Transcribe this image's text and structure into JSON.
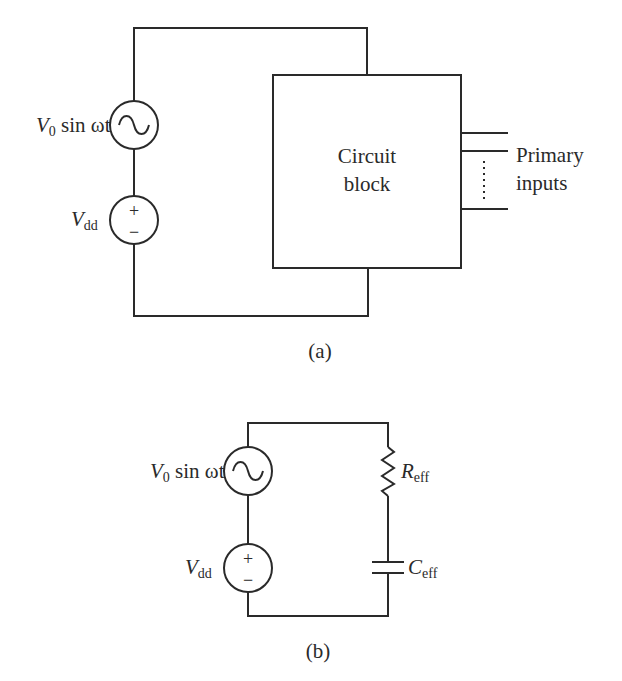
{
  "figure_a": {
    "caption": "(a)",
    "ac_source": {
      "label_main": "V",
      "label_sub": "0",
      "label_rest": " sin ωt",
      "icon": "sine-wave-icon"
    },
    "dc_source": {
      "label_main": "V",
      "label_sub": "dd",
      "plus": "+",
      "minus": "−"
    },
    "block": {
      "line1": "Circuit",
      "line2": "block"
    },
    "inputs": {
      "line1": "Primary",
      "line2": "inputs"
    }
  },
  "figure_b": {
    "caption": "(b)",
    "ac_source": {
      "label_main": "V",
      "label_sub": "0",
      "label_rest": " sin ωt",
      "icon": "sine-wave-icon"
    },
    "dc_source": {
      "label_main": "V",
      "label_sub": "dd",
      "plus": "+",
      "minus": "−"
    },
    "resistor": {
      "label_main": "R",
      "label_sub": "eff"
    },
    "capacitor": {
      "label_main": "C",
      "label_sub": "eff"
    }
  },
  "colors": {
    "stroke": "#2a2a2a",
    "background": "#ffffff"
  }
}
